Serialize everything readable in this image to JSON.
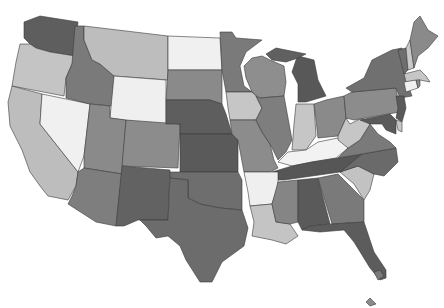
{
  "map": {
    "type": "choropleth",
    "region": "United States",
    "palette": {
      "lightest": "#f2f2f2",
      "light": "#c8c8c8",
      "mid_light": "#a4a4a4",
      "mid": "#8a8a8a",
      "mid_dark": "#6e6e6e",
      "dark": "#585858"
    },
    "states": [
      {
        "id": "WA",
        "fill": "#5e5e5e",
        "points": "24,22 40,16 78,22 75,56 50,52 36,48 30,44 24,38"
      },
      {
        "id": "OR",
        "fill": "#c4c4c4",
        "points": "20,44 30,44 36,48 50,52 75,56 72,64 66,78 64,96 12,86 16,62"
      },
      {
        "id": "CA",
        "fill": "#bdbdbd",
        "points": "12,86 42,94 40,124 78,172 76,186 68,200 48,196 40,186 30,172 22,150 10,126 8,102"
      },
      {
        "id": "NV",
        "fill": "#f0f0f0",
        "points": "42,94 90,104 84,156 78,172 40,124"
      },
      {
        "id": "ID",
        "fill": "#7a7a7a",
        "points": "75,26 84,26 84,40 92,60 100,64 114,76 112,106 90,104 66,98 66,78 72,64"
      },
      {
        "id": "MT",
        "fill": "#bdbdbd",
        "points": "84,26 168,36 168,80 114,76 100,64 92,60 84,40"
      },
      {
        "id": "WY",
        "fill": "#efefef",
        "points": "114,76 166,80 166,126 110,118"
      },
      {
        "id": "UT",
        "fill": "#8a8a8a",
        "points": "90,104 110,106 110,118 126,120 122,174 84,168 84,156"
      },
      {
        "id": "AZ",
        "fill": "#7e7e7e",
        "points": "84,168 122,174 116,226 96,222 68,204 72,196 76,186 78,172"
      },
      {
        "id": "CO",
        "fill": "#8c8c8c",
        "points": "126,120 180,124 178,168 122,166"
      },
      {
        "id": "NM",
        "fill": "#626262",
        "points": "122,166 170,170 168,220 138,220 124,226 116,226"
      },
      {
        "id": "ND",
        "fill": "#f0f0f0",
        "points": "168,36 220,38 222,70 168,70"
      },
      {
        "id": "SD",
        "fill": "#8a8a8a",
        "points": "168,70 222,70 222,104 210,100 166,100"
      },
      {
        "id": "NE",
        "fill": "#5e5e5e",
        "points": "166,100 210,100 222,104 226,114 232,134 180,134 180,124 166,124"
      },
      {
        "id": "KS",
        "fill": "#5a5a5a",
        "points": "180,134 232,134 238,140 238,172 180,172"
      },
      {
        "id": "OK",
        "fill": "#6e6e6e",
        "points": "170,172 238,172 242,180 242,210 220,208 200,204 188,198 188,180 170,178"
      },
      {
        "id": "TX",
        "fill": "#6c6c6c",
        "points": "170,178 188,180 188,198 200,204 220,208 242,210 248,228 244,246 222,262 212,282 200,282 186,260 180,246 168,236 156,238 146,226 140,220 168,220"
      },
      {
        "id": "MN",
        "fill": "#7a7a7a",
        "points": "220,32 232,32 236,38 262,40 246,52 240,66 244,86 252,92 226,92 222,70"
      },
      {
        "id": "IA",
        "fill": "#c6c6c6",
        "points": "226,92 252,92 256,96 262,108 256,120 230,120 228,108"
      },
      {
        "id": "MO",
        "fill": "#8c8c8c",
        "points": "230,120 256,120 262,132 270,144 274,160 278,168 270,172 244,172 238,140 232,134"
      },
      {
        "id": "WI",
        "fill": "#8e8e8e",
        "points": "252,58 262,56 270,60 284,66 286,82 284,96 260,98 252,92 246,78 244,66"
      },
      {
        "id": "IL",
        "fill": "#7e7e7e",
        "points": "260,98 284,96 288,118 292,140 286,152 278,160 270,144 262,132 256,120 262,108 256,96"
      },
      {
        "id": "MI",
        "fill": "#585858",
        "points": "298,56 314,60 318,80 326,96 306,102 298,102 298,84 292,72 296,60"
      },
      {
        "id": "MIU",
        "fill": "#606060",
        "points": "266,54 276,48 296,52 306,54 298,58 286,62 272,60"
      },
      {
        "id": "IN",
        "fill": "#c6c6c6",
        "points": "296,104 314,104 316,136 306,150 292,150 294,124"
      },
      {
        "id": "OH",
        "fill": "#8a8a8a",
        "points": "314,104 326,100 344,96 346,118 338,136 318,138 316,120"
      },
      {
        "id": "KY",
        "fill": "#f2f2f2",
        "points": "278,162 288,152 306,150 318,142 338,138 348,148 336,158 312,162 292,166"
      },
      {
        "id": "TN",
        "fill": "#565656",
        "points": "272,172 292,166 312,162 338,158 362,154 358,166 340,172 284,180 272,180"
      },
      {
        "id": "AR",
        "fill": "#efefef",
        "points": "244,172 270,172 278,172 278,186 272,204 250,206 248,192"
      },
      {
        "id": "LA",
        "fill": "#c4c4c4",
        "points": "250,206 272,204 276,222 290,224 298,236 286,244 272,240 252,236 254,222"
      },
      {
        "id": "MS",
        "fill": "#858585",
        "points": "278,182 298,180 298,222 290,224 276,222 272,204"
      },
      {
        "id": "AL",
        "fill": "#5a5a5a",
        "points": "298,180 318,178 330,224 310,226 302,230 298,222"
      },
      {
        "id": "GA",
        "fill": "#7a7a7a",
        "points": "318,178 338,174 364,200 364,222 332,224"
      },
      {
        "id": "FL",
        "fill": "#5c5c5c",
        "points": "302,230 310,226 332,224 364,222 374,252 386,270 386,278 380,280 370,268 354,242 344,230 320,232"
      },
      {
        "id": "SC",
        "fill": "#c2c2c2",
        "points": "340,172 358,166 374,174 370,190 364,200 354,184"
      },
      {
        "id": "NC",
        "fill": "#6a6a6a",
        "points": "340,172 362,154 396,148 398,162 384,176 374,174 358,166"
      },
      {
        "id": "VA",
        "fill": "#7a7a7a",
        "points": "338,158 348,148 360,140 370,124 378,134 390,142 396,148 362,154"
      },
      {
        "id": "WV",
        "fill": "#c6c6c6",
        "points": "338,136 346,118 350,124 362,118 370,124 360,140 348,148 338,140"
      },
      {
        "id": "PA",
        "fill": "#8c8c8c",
        "points": "344,96 352,92 396,88 400,112 388,114 354,120 346,118"
      },
      {
        "id": "NY",
        "fill": "#707070",
        "points": "346,88 364,78 372,60 392,50 402,48 406,80 412,96 400,98 396,88 352,92"
      },
      {
        "id": "VT",
        "fill": "#6e6e6e",
        "points": "398,50 406,48 408,70 404,74"
      },
      {
        "id": "NH",
        "fill": "#c8c8c8",
        "points": "406,48 410,40 414,68 408,70"
      },
      {
        "id": "ME",
        "fill": "#8a8a8a",
        "points": "410,40 414,22 420,16 428,30 438,36 428,48 418,56 414,68"
      },
      {
        "id": "MA",
        "fill": "#c6c6c6",
        "points": "404,74 420,70 426,76 430,82 420,80 406,82"
      },
      {
        "id": "CT",
        "fill": "#f0f0f0",
        "points": "404,82 416,80 418,88 406,92"
      },
      {
        "id": "RI",
        "fill": "#8a8a8a",
        "points": "416,80 420,80 420,86 418,88"
      },
      {
        "id": "NJ",
        "fill": "#5a5a5a",
        "points": "396,96 404,96 406,108 402,122 396,118 398,108"
      },
      {
        "id": "DE",
        "fill": "#c8c8c8",
        "points": "396,120 402,122 402,132 398,130"
      },
      {
        "id": "MD",
        "fill": "#5a5a5a",
        "points": "360,120 390,114 396,120 396,134 386,130 382,124 370,124"
      },
      {
        "id": "HI1",
        "fill": "#7a7a7a",
        "points": "374,272 380,270 384,276 378,280"
      },
      {
        "id": "HI2",
        "fill": "#8a8a8a",
        "points": "366,302 370,298 376,304 370,306"
      }
    ]
  }
}
